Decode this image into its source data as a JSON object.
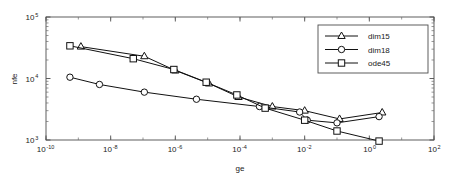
{
  "chart_data": {
    "type": "line",
    "title": "",
    "xlabel": "ge",
    "ylabel": "nfe",
    "xscale": "log",
    "yscale": "log",
    "xlim": [
      1e-10,
      100.0
    ],
    "ylim": [
      1000.0,
      100000.0
    ],
    "grid": false,
    "legend_position": "top-right",
    "xticks": [
      {
        "value": 1e-10,
        "mantissa": "10",
        "exponent": "-10"
      },
      {
        "value": 1e-08,
        "mantissa": "10",
        "exponent": "-8"
      },
      {
        "value": 1e-06,
        "mantissa": "10",
        "exponent": "-6"
      },
      {
        "value": 0.0001,
        "mantissa": "10",
        "exponent": "-4"
      },
      {
        "value": 0.01,
        "mantissa": "10",
        "exponent": "-2"
      },
      {
        "value": 1.0,
        "mantissa": "10",
        "exponent": "0"
      },
      {
        "value": 100.0,
        "mantissa": "10",
        "exponent": "2"
      }
    ],
    "yticks": [
      {
        "value": 1000.0,
        "mantissa": "10",
        "exponent": "3"
      },
      {
        "value": 10000.0,
        "mantissa": "10",
        "exponent": "4"
      },
      {
        "value": 100000.0,
        "mantissa": "10",
        "exponent": "5"
      }
    ],
    "series": [
      {
        "name": "dim15",
        "marker": "triangle",
        "color": "#111111",
        "x": [
          1.2e-09,
          1.1e-07,
          1e-06,
          1.1e-05,
          9e-05,
          0.001,
          0.01,
          0.12,
          2.5
        ],
        "y": [
          33000,
          23000,
          13500,
          8300,
          5000,
          3500,
          3000,
          2200,
          2800
        ]
      },
      {
        "name": "dim18",
        "marker": "circle",
        "color": "#111111",
        "x": [
          5.5e-10,
          4.5e-09,
          1.1e-07,
          4.5e-06,
          0.0004,
          0.007,
          0.012,
          0.1,
          2.0
        ],
        "y": [
          10500,
          8000,
          6000,
          4600,
          3500,
          2850,
          2100,
          1900,
          2400
        ]
      },
      {
        "name": "ode45",
        "marker": "square",
        "color": "#111111",
        "x": [
          5.5e-10,
          5e-08,
          9e-07,
          9e-06,
          8e-05,
          0.0006,
          0.01,
          0.1,
          2.0
        ],
        "y": [
          34000,
          21000,
          14000,
          8700,
          5400,
          3300,
          2100,
          1400,
          960
        ]
      }
    ]
  },
  "legend": {
    "entries": [
      {
        "label": "dim15",
        "marker": "triangle"
      },
      {
        "label": "dim18",
        "marker": "circle"
      },
      {
        "label": "ode45",
        "marker": "square"
      }
    ]
  }
}
